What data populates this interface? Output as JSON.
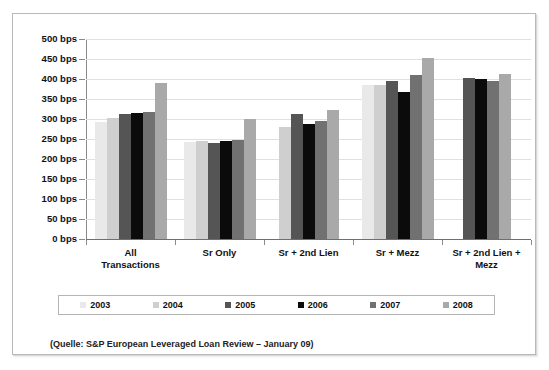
{
  "chart_data": {
    "type": "bar",
    "title": "",
    "xlabel": "",
    "ylabel": "",
    "ylim": [
      0,
      500
    ],
    "grid": true,
    "legend_position": "bottom",
    "unit": "bps",
    "categories": [
      "All Transactions",
      "Sr Only",
      "Sr + 2nd Lien",
      "Sr + Mezz",
      "Sr + 2nd Lien + Mezz"
    ],
    "category_lines": [
      [
        "All",
        "Transactions"
      ],
      [
        "Sr Only"
      ],
      [
        "Sr + 2nd Lien"
      ],
      [
        "Sr + Mezz"
      ],
      [
        "Sr + 2nd Lien +",
        "Mezz"
      ]
    ],
    "series": [
      {
        "name": "2003",
        "color": "#e9e9e9",
        "values": [
          293,
          243,
          null,
          385,
          null
        ]
      },
      {
        "name": "2004",
        "color": "#cfcfcf",
        "values": [
          303,
          245,
          280,
          385,
          null
        ]
      },
      {
        "name": "2005",
        "color": "#555555",
        "values": [
          313,
          241,
          312,
          395,
          402
        ]
      },
      {
        "name": "2006",
        "color": "#0b0b0b",
        "values": [
          315,
          246,
          288,
          368,
          400
        ]
      },
      {
        "name": "2007",
        "color": "#717171",
        "values": [
          317,
          247,
          295,
          410,
          395
        ]
      },
      {
        "name": "2008",
        "color": "#a9a9a9",
        "values": [
          390,
          300,
          322,
          452,
          412
        ]
      }
    ],
    "yticks": [
      0,
      50,
      100,
      150,
      200,
      250,
      300,
      350,
      400,
      450,
      500
    ],
    "ytick_labels": [
      "0 bps",
      "50 bps",
      "100 bps",
      "150 bps",
      "200 bps",
      "250 bps",
      "300 bps",
      "350 bps",
      "400 bps",
      "450 bps",
      "500 bps"
    ]
  },
  "legend": {
    "items": [
      {
        "label": "2003"
      },
      {
        "label": "2004"
      },
      {
        "label": "2005"
      },
      {
        "label": "2006"
      },
      {
        "label": "2007"
      },
      {
        "label": "2008"
      }
    ]
  },
  "source": {
    "text": "(Quelle: S&P European Leveraged Loan Review – January 09)"
  }
}
